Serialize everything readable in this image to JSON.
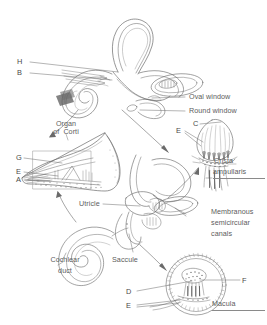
{
  "figure": {
    "type": "anatomical-line-diagram",
    "background_color": "#ffffff",
    "ink_color": "#5d5d5d"
  },
  "panels": [
    {
      "id": "bony-labyrinth",
      "name": "Bony labyrinth with cochlea and semicircular canals"
    },
    {
      "id": "organ-of-corti",
      "name": "Cross section of cochlear duct showing organ of Corti"
    },
    {
      "id": "membranous-labyrinth",
      "name": "Membranous labyrinth with utricle, saccule and cochlear duct"
    },
    {
      "id": "crista-ampullaris",
      "name": "Crista ampullaris detail"
    },
    {
      "id": "macula",
      "name": "Macula detail"
    }
  ],
  "labels": {
    "oval_window": "Oval window",
    "round_window": "Round window",
    "organ_of_corti_line1": "Organ",
    "organ_of_corti_line2": "of  Corti",
    "crista_line1": "Crista",
    "crista_line2": "ampullaris",
    "membranous_line1": "Membranous",
    "membranous_line2": "semicircular",
    "membranous_line3": "canals",
    "utricle": "Utricle",
    "saccule": "Saccule",
    "cochlear_duct_line1": "Cochlear",
    "cochlear_duct_line2": "duct",
    "macula": "Macula"
  },
  "keys": {
    "h": "H",
    "b": "B",
    "g": "G",
    "e_corti": "E",
    "a": "A",
    "c": "C",
    "e_crista": "E",
    "d": "D",
    "e_macula": "E",
    "f": "F"
  }
}
